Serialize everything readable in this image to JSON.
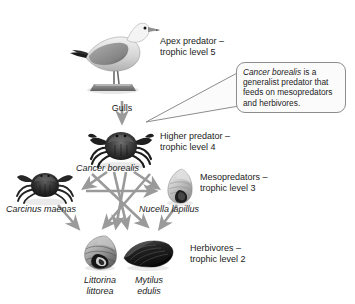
{
  "diagram": {
    "background": "#ffffff",
    "arrow_color": "#9a9a9a"
  },
  "trophic_labels": [
    {
      "id": "apex",
      "line1": "Apex predator –",
      "line2": "trophic level 5"
    },
    {
      "id": "higher",
      "line1": "Higher predator –",
      "line2": "trophic level 4"
    },
    {
      "id": "meso",
      "line1": "Mesopredators –",
      "line2": "trophic level 3"
    },
    {
      "id": "herb",
      "line1": "Herbivores –",
      "line2": "trophic level 2"
    }
  ],
  "organisms": [
    {
      "id": "gull",
      "common_name": "Gulls",
      "species": "",
      "trophic_level": 5
    },
    {
      "id": "cancer",
      "common_name": "",
      "species": "Cancer borealis",
      "trophic_level": 4
    },
    {
      "id": "carcinus",
      "common_name": "",
      "species": "Carcinus maenas",
      "trophic_level": 3
    },
    {
      "id": "nucella",
      "common_name": "",
      "species": "Nucella lapillus",
      "trophic_level": 3
    },
    {
      "id": "littorina",
      "common_name": "",
      "species_line1": "Littorina",
      "species_line2": "littorea",
      "trophic_level": 2
    },
    {
      "id": "mytilus",
      "common_name": "",
      "species_line1": "Mytilus",
      "species_line2": "edulis",
      "trophic_level": 2
    }
  ],
  "callout": {
    "species": "Cancer borealis",
    "text_after_species": " is a generalist predator that feeds on mesopredators and herbivores."
  },
  "feeding_links": [
    {
      "from": "gull",
      "to": "cancer"
    },
    {
      "from": "cancer",
      "to": "carcinus"
    },
    {
      "from": "cancer",
      "to": "nucella"
    },
    {
      "from": "cancer",
      "to": "littorina"
    },
    {
      "from": "cancer",
      "to": "mytilus"
    },
    {
      "from": "carcinus",
      "to": "nucella"
    },
    {
      "from": "carcinus",
      "to": "littorina"
    },
    {
      "from": "carcinus",
      "to": "mytilus"
    },
    {
      "from": "nucella",
      "to": "littorina"
    },
    {
      "from": "nucella",
      "to": "mytilus"
    }
  ]
}
